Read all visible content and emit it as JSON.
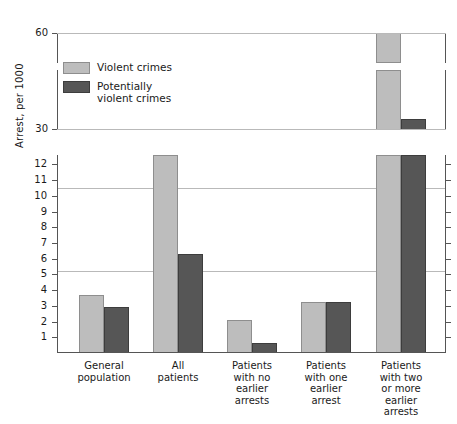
{
  "chart_data": {
    "type": "bar",
    "title": "",
    "xlabel": "",
    "ylabel": "Arrest, per 1000",
    "grid": true,
    "legend_position": "upper-left-inset",
    "broken_axis": true,
    "axis_note": "Y axis is broken into three panels: 0-12 (lower, ticks every 1), 30-60 mid/upper break region",
    "panels": [
      {
        "name": "upper",
        "ticks": [
          60
        ],
        "range": [
          55,
          63
        ]
      },
      {
        "name": "middle",
        "ticks": [
          30
        ],
        "range": [
          24,
          55
        ]
      },
      {
        "name": "lower",
        "ticks": [
          1,
          2,
          3,
          4,
          5,
          6,
          7,
          8,
          9,
          10,
          11,
          12
        ],
        "range": [
          0,
          12.6
        ],
        "gridlines": [
          5,
          10
        ]
      }
    ],
    "categories": [
      "General population",
      "All patients",
      "Patients with no earlier arrests",
      "Patients with one earlier arrest",
      "Patients with two or more earlier arrests"
    ],
    "category_lines": [
      [
        "General",
        "population"
      ],
      [
        "All",
        "patients"
      ],
      [
        "Patients",
        "with no",
        "earlier",
        "arrests"
      ],
      [
        "Patients",
        "with one",
        "earlier",
        "arrest"
      ],
      [
        "Patients",
        "with two",
        "or more",
        "earlier",
        "arrests"
      ]
    ],
    "series": [
      {
        "name": "Violent crimes",
        "color": "#bdbdbd",
        "values": [
          3.5,
          12.0,
          2.0,
          3.1,
          62.0
        ]
      },
      {
        "name": "Potentially violent crimes",
        "color": "#565656",
        "values": [
          2.75,
          6.0,
          0.6,
          3.1,
          33.0
        ]
      }
    ],
    "ylim": [
      0,
      63
    ]
  },
  "legend": {
    "items": [
      {
        "label": "Violent crimes",
        "swatch": "violent"
      },
      {
        "label": "Potentially violent crimes",
        "swatch": "potential"
      }
    ]
  },
  "axis": {
    "y_title": "Arrest, per 1000",
    "lower_ticks": [
      "12",
      "11",
      "10",
      "9",
      "8",
      "7",
      "6",
      "5",
      "4",
      "3",
      "2",
      "1"
    ],
    "mid_tick": "30",
    "top_tick": "60"
  }
}
